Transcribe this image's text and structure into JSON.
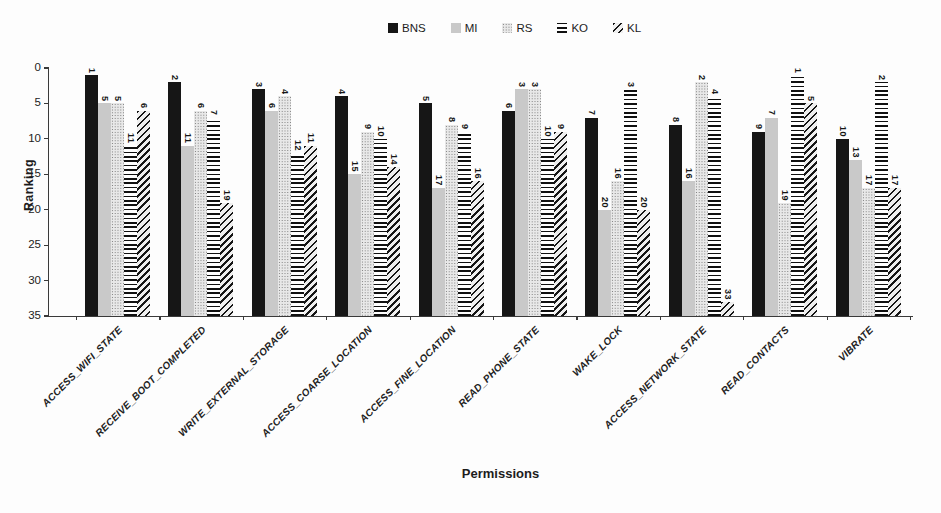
{
  "chart_data": {
    "type": "bar",
    "title": "",
    "xlabel": "Permissions",
    "ylabel": "Ranking",
    "y_axis_inverted": true,
    "ylim": [
      0,
      35
    ],
    "y_ticks": [
      0,
      5,
      10,
      15,
      20,
      25,
      30,
      35
    ],
    "grid": false,
    "legend_position": "top-center",
    "bar_note": "bars extend from their ranking value down to the 35 baseline; every bar has a vertical value label above it",
    "categories": [
      "ACCESS_WIFI_STATE",
      "RECEIVE_BOOT_COMPLETED",
      "WRITE_EXTERNAL_STORAGE",
      "ACCESS_COARSE_LOCATION",
      "ACCESS_FINE_LOCATION",
      "READ_PHONE_STATE",
      "WAKE_LOCK",
      "ACCESS_NETWORK_STATE",
      "READ_CONTACTS",
      "VIBRATE"
    ],
    "series": [
      {
        "name": "BNS",
        "pattern": "solid-black",
        "color": "#161616",
        "values": [
          1,
          2,
          3,
          4,
          5,
          6,
          7,
          8,
          9,
          10
        ]
      },
      {
        "name": "MI",
        "pattern": "solid-light-gray",
        "color": "#c9c9c9",
        "values": [
          5,
          11,
          6,
          15,
          17,
          3,
          20,
          16,
          7,
          13
        ]
      },
      {
        "name": "RS",
        "pattern": "dotted-checker",
        "color": "#8a8a8a",
        "values": [
          5,
          6,
          4,
          9,
          8,
          3,
          16,
          2,
          19,
          17
        ]
      },
      {
        "name": "KO",
        "pattern": "horizontal-stripes",
        "color": "#111111",
        "values": [
          11,
          7,
          12,
          10,
          9,
          10,
          3,
          4,
          1,
          2
        ]
      },
      {
        "name": "KL",
        "pattern": "diagonal-stripes",
        "color": "#1a1a1a",
        "values": [
          6,
          19,
          11,
          14,
          16,
          9,
          20,
          33,
          5,
          17
        ]
      }
    ]
  }
}
